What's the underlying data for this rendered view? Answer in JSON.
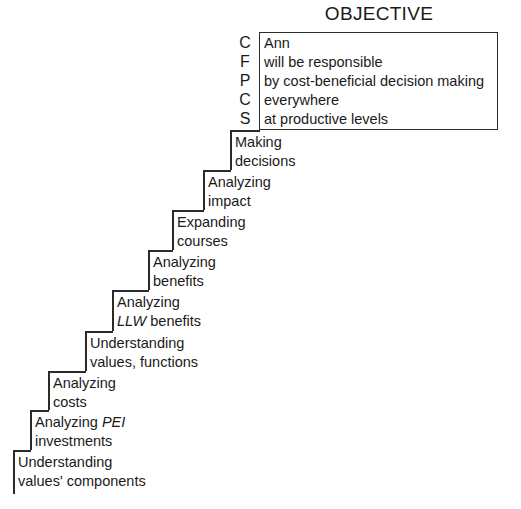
{
  "diagram": {
    "title": "OBJECTIVE",
    "objective_box": {
      "prefix_letters": [
        "C",
        "F",
        "P",
        "C",
        "S"
      ],
      "lines": [
        "Ann",
        "will be responsible",
        "by cost-beneficial decision making",
        "everywhere",
        "at productive levels"
      ]
    },
    "steps": [
      {
        "line1": "Making",
        "line2": "decisions",
        "italic2": ""
      },
      {
        "line1": "Analyzing",
        "line2": "impact",
        "italic2": ""
      },
      {
        "line1": "Expanding",
        "line2": "courses",
        "italic2": ""
      },
      {
        "line1": "Analyzing",
        "line2": "benefits",
        "italic2": ""
      },
      {
        "line1": "Analyzing",
        "line2": " benefits",
        "italic2": "LLW"
      },
      {
        "line1": "Understanding",
        "line2": "values, functions",
        "italic2": ""
      },
      {
        "line1": "Analyzing",
        "line2": "costs",
        "italic2": ""
      },
      {
        "line1": "Analyzing ",
        "line2": "investments",
        "italic1": "PEI"
      },
      {
        "line1": "Understanding",
        "line2": "values' components",
        "italic2": ""
      }
    ],
    "colors": {
      "line": "#2b2b2b",
      "text": "#1a1a1a",
      "background": "#ffffff"
    }
  }
}
